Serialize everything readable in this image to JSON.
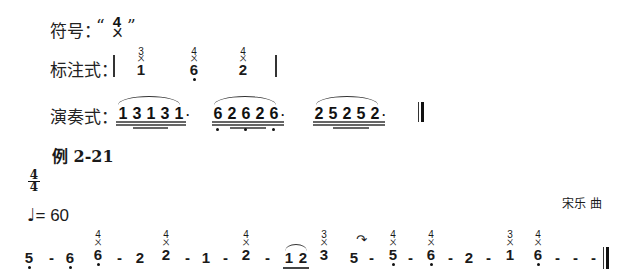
{
  "symbol_row": {
    "label": "符号：",
    "open_quote": "“",
    "close_quote": "”",
    "mark_top": "4",
    "mark_bottom": "ㄨ"
  },
  "notation_row": {
    "label": "标注式：",
    "notes": [
      {
        "finger": "3",
        "mark": "ㄨ",
        "digit": "1",
        "dot_below": false
      },
      {
        "finger": "4",
        "mark": "ㄨ",
        "digit": "6",
        "dot_below": true
      },
      {
        "finger": "4",
        "mark": "ㄨ",
        "digit": "2",
        "dot_below": false
      }
    ]
  },
  "performance_row": {
    "label": "演奏式：",
    "groups": [
      {
        "digits": [
          "1",
          "3",
          "1",
          "3",
          "1"
        ],
        "dots_below": [
          false,
          false,
          false,
          false,
          false
        ],
        "trailing_dot": "·"
      },
      {
        "digits": [
          "6",
          "2",
          "6",
          "2",
          "6"
        ],
        "dots_below": [
          true,
          false,
          true,
          false,
          true
        ],
        "trailing_dot": "·"
      },
      {
        "digits": [
          "2",
          "5",
          "2",
          "5",
          "2"
        ],
        "dots_below": [
          false,
          false,
          false,
          false,
          false
        ],
        "trailing_dot": "·"
      }
    ]
  },
  "example": {
    "title": "例 2-21",
    "time_signature": {
      "top": "4",
      "bottom": "4"
    },
    "tempo": {
      "note_glyph": "♩",
      "text": "= 60"
    },
    "composer": "宋乐  曲",
    "score": [
      {
        "digit": "5",
        "dot_below": true
      },
      {
        "dash": "-"
      },
      {
        "digit": "6",
        "dot_below": true
      },
      {
        "digit": "6",
        "dot_below": true,
        "finger": "4",
        "mark": "ㄨ"
      },
      {
        "dash": "-"
      },
      {
        "digit": "2"
      },
      {
        "digit": "2",
        "finger": "4",
        "mark": "ㄨ"
      },
      {
        "dash": "-"
      },
      {
        "digit": "1"
      },
      {
        "dash": "-"
      },
      {
        "digit": "2",
        "finger": "4",
        "mark": "ㄨ"
      },
      {
        "dash": "-"
      },
      {
        "digit": "1",
        "underline": true,
        "slur_start": true
      },
      {
        "digit": "2",
        "underline": true,
        "slur_end": true
      },
      {
        "digit": "3",
        "finger": "3",
        "mark": "ㄨ"
      },
      {
        "digit": "5"
      },
      {
        "dash": "-",
        "turn_mark": "↷"
      },
      {
        "digit": "5",
        "dot_below": true,
        "finger": "4",
        "mark": "ㄨ"
      },
      {
        "dash": "-"
      },
      {
        "digit": "6",
        "dot_below": true,
        "finger": "4",
        "mark": "ㄨ"
      },
      {
        "dash": "-"
      },
      {
        "digit": "2"
      },
      {
        "dash": "-"
      },
      {
        "digit": "1",
        "finger": "3",
        "mark": "ㄨ"
      },
      {
        "digit": "6",
        "dot_below": true,
        "finger": "4",
        "mark": "ㄨ"
      },
      {
        "dash": "-"
      },
      {
        "dash": "-"
      },
      {
        "dash": "-"
      }
    ]
  }
}
